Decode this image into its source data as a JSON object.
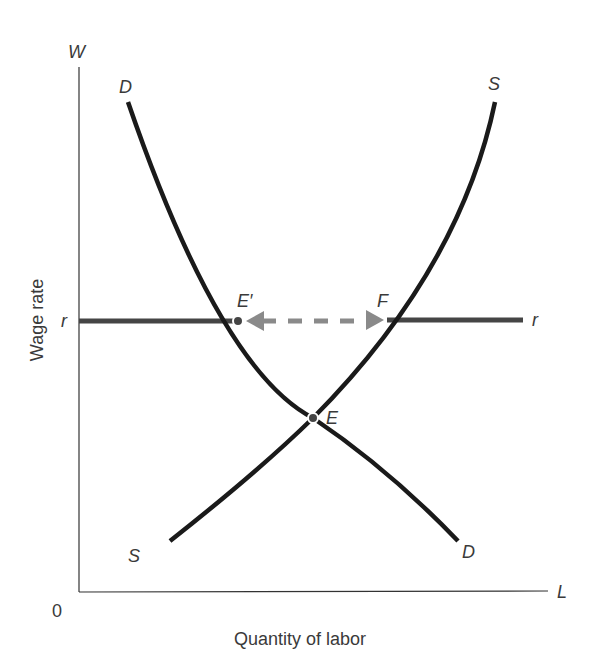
{
  "diagram": {
    "axes": {
      "y_axis_letter": "W",
      "x_axis_letter": "L",
      "origin": "0",
      "y_label": "Wage rate",
      "x_label": "Quantity of labor"
    },
    "curves": {
      "demand_top_label": "D",
      "demand_bottom_label": "D",
      "supply_top_label": "S",
      "supply_bottom_label": "S"
    },
    "wage_line": {
      "left_label": "r",
      "right_label": "r"
    },
    "points": {
      "e_prime": "E′",
      "f": "F",
      "e": "E"
    },
    "colors": {
      "curve": "#1a1a1a",
      "wage_line": "#454545",
      "arrow": "#8a8a8a",
      "axis": "#333333",
      "text": "#3a3a3a"
    }
  }
}
